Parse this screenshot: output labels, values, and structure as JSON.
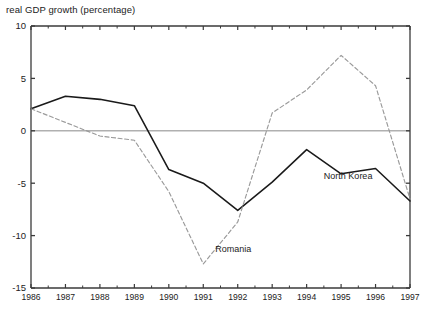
{
  "axis_title": "real GDP growth (percentage)",
  "colors": {
    "frame": "#3a3a3a",
    "zero_line": "#b0b0b0",
    "north_korea": "#1a1a1a",
    "romania": "#9a9a9a",
    "text": "#222222",
    "background": "#ffffff"
  },
  "labels": {
    "north_korea": "North Korea",
    "romania": "Romania"
  },
  "chart_data": {
    "type": "line",
    "title": "",
    "xlabel": "",
    "ylabel": "real GDP growth (percentage)",
    "x": [
      1986,
      1987,
      1988,
      1989,
      1990,
      1991,
      1992,
      1993,
      1994,
      1995,
      1996,
      1997
    ],
    "xticklabels": [
      "1986",
      "1987",
      "1988",
      "1989",
      "1990",
      "1991",
      "1992",
      "1993",
      "1994",
      "1995",
      "1996",
      "1997"
    ],
    "yticks": [
      10,
      5,
      0,
      -5,
      -10,
      -15
    ],
    "yticklabels": [
      "10",
      "5",
      "0",
      "-5",
      "-10",
      "-15"
    ],
    "ylim": [
      -15,
      10
    ],
    "xlim": [
      1986,
      1997
    ],
    "grid": false,
    "zero_line": true,
    "legend": "inline-annotations",
    "series": [
      {
        "name": "North Korea",
        "style": "solid",
        "color": "#1a1a1a",
        "values": [
          2.1,
          3.3,
          3.0,
          2.4,
          -3.7,
          -5.0,
          -7.6,
          -4.9,
          -1.8,
          -4.1,
          -3.6,
          -6.7
        ],
        "label_x": 1994.5,
        "label_y": -4.6
      },
      {
        "name": "Romania",
        "style": "dashed",
        "color": "#9a9a9a",
        "values": [
          2.1,
          0.8,
          -0.5,
          -0.9,
          -5.8,
          -12.7,
          -8.7,
          1.7,
          3.9,
          7.2,
          4.3,
          -6.5
        ],
        "label_x": 1991.35,
        "label_y": -11.6
      }
    ]
  }
}
